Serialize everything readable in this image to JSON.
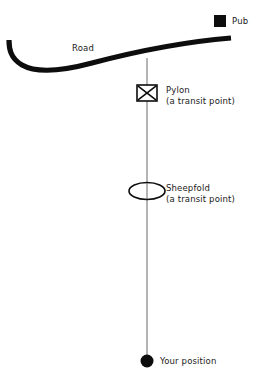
{
  "diagram": {
    "background_color": "#ffffff",
    "width": 271,
    "height": 390,
    "features": {
      "pub": {
        "label": "Pub",
        "marker": "filled-square",
        "marker_color": "#000000",
        "x": 220,
        "y": 21
      },
      "road": {
        "label": "Road",
        "marker": "thick-curved-line",
        "marker_color": "#000000",
        "stroke_width": 5
      },
      "pylon": {
        "label": "Pylon",
        "sublabel": "(a transit point)",
        "marker": "crossed-rectangle",
        "marker_color": "#000000",
        "x": 147,
        "y": 93
      },
      "sheepfold": {
        "label": "Sheepfold",
        "sublabel": "(a transit point)",
        "marker": "ellipse-outline",
        "marker_color": "#000000",
        "x": 147,
        "y": 191
      },
      "your_position": {
        "label": "Your position",
        "marker": "filled-circle",
        "marker_color": "#000000",
        "x": 147,
        "y": 361
      },
      "bearing_line": {
        "marker": "thin-vertical-line",
        "marker_color": "#8c8c8c",
        "x": 147,
        "y_top": 58,
        "y_bottom": 361
      }
    }
  }
}
